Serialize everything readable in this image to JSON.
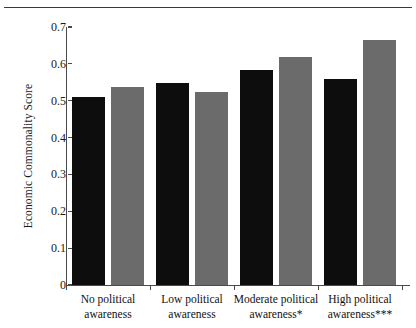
{
  "figure": {
    "background": "#ffffff",
    "bar_colors": {
      "group_a": "#0d0d0d",
      "group_b": "#6b6b6b"
    },
    "axis_color": "#4a4a4a",
    "rule_color": "#3a3a3a"
  },
  "chart_data": {
    "type": "bar",
    "title": "",
    "subtitle": "",
    "xlabel": "",
    "ylabel": "Economic Commonality Score",
    "ylim": [
      0,
      0.7
    ],
    "yticks": [
      "0",
      "0.1",
      "0.2",
      "0.3",
      "0.4",
      "0.5",
      "0.6",
      "0.7"
    ],
    "ytick_values": [
      0,
      0.1,
      0.2,
      0.3,
      0.4,
      0.5,
      0.6,
      0.7
    ],
    "grid": false,
    "legend": "none",
    "categories": [
      "No political awareness",
      "Low political awareness",
      "Moderate political awareness*",
      "High political awareness***"
    ],
    "category_lines": [
      [
        "No political",
        "awareness"
      ],
      [
        "Low political",
        "awareness"
      ],
      [
        "Moderate political",
        "awareness*"
      ],
      [
        "High political",
        "awareness***"
      ]
    ],
    "series": [
      {
        "name": "Series 1",
        "color": "#0d0d0d",
        "values": [
          0.511,
          0.547,
          0.583,
          0.558
        ]
      },
      {
        "name": "Series 2",
        "color": "#6b6b6b",
        "values": [
          0.537,
          0.525,
          0.619,
          0.665
        ]
      }
    ]
  }
}
